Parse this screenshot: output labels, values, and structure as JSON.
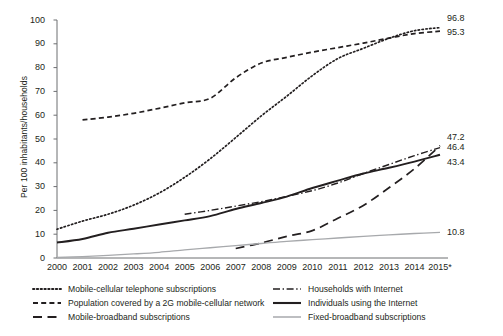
{
  "chart_data": {
    "type": "line",
    "title": "",
    "xlabel": "",
    "ylabel": "Per 100 inhabitants/households",
    "ylim": [
      0,
      100
    ],
    "ytick_step": 10,
    "yticks": [
      0,
      10,
      20,
      30,
      40,
      50,
      60,
      70,
      80,
      90,
      100
    ],
    "grid": false,
    "legend_position": "bottom",
    "categories": [
      "2000",
      "2001",
      "2002",
      "2003",
      "2004",
      "2005",
      "2006",
      "2007",
      "2008",
      "2009",
      "2010",
      "2011",
      "2012",
      "2013",
      "2014",
      "2015*"
    ],
    "x": [
      2000,
      2001,
      2002,
      2003,
      2004,
      2005,
      2006,
      2007,
      2008,
      2009,
      2010,
      2011,
      2012,
      2013,
      2014,
      2015
    ],
    "series": [
      {
        "name": "Mobile-cellular telephone subscriptions",
        "style": "dotted",
        "color": "#231f20",
        "end_label": "96.8",
        "values": [
          12.1,
          15.5,
          18.4,
          22.2,
          27.3,
          33.9,
          41.7,
          50.6,
          59.7,
          68.0,
          76.6,
          83.8,
          88.1,
          92.3,
          95.5,
          96.8
        ]
      },
      {
        "name": "Population covered by a 2G mobile-cellular network",
        "style": "dashed",
        "color": "#231f20",
        "end_label": "95.3",
        "values": [
          null,
          58.0,
          59.2,
          60.8,
          62.9,
          65.2,
          67.1,
          75.7,
          81.9,
          84.3,
          86.5,
          88.4,
          90.3,
          92.4,
          94.3,
          95.3
        ]
      },
      {
        "name": "Mobile-broadband subscriptions",
        "style": "long-dash",
        "color": "#231f20",
        "end_label": "47.2",
        "values": [
          null,
          null,
          null,
          null,
          null,
          null,
          null,
          4.0,
          6.3,
          9.1,
          11.5,
          16.7,
          22.1,
          29.5,
          37.5,
          47.2
        ]
      },
      {
        "name": "Households with Internet",
        "style": "dash-dot",
        "color": "#231f20",
        "end_label": "46.4",
        "values": [
          null,
          null,
          null,
          null,
          null,
          18.4,
          20.0,
          21.8,
          23.7,
          25.9,
          28.3,
          31.5,
          35.5,
          39.3,
          43.0,
          46.4
        ]
      },
      {
        "name": "Individuals using the Internet",
        "style": "solid",
        "color": "#231f20",
        "end_label": "43.4",
        "values": [
          6.5,
          8.0,
          10.6,
          12.3,
          14.1,
          15.8,
          17.6,
          20.6,
          23.1,
          25.8,
          29.4,
          32.5,
          35.5,
          37.9,
          40.5,
          43.4
        ]
      },
      {
        "name": "Fixed-broadband subscriptions",
        "style": "solid-grey",
        "color": "#a7a9ac",
        "end_label": "10.8",
        "values": [
          0.2,
          0.6,
          1.1,
          1.7,
          2.4,
          3.4,
          4.3,
          5.2,
          6.1,
          7.0,
          7.7,
          8.4,
          9.1,
          9.7,
          10.3,
          10.8
        ]
      }
    ],
    "end_labels": [
      {
        "text": "96.8",
        "value": 96.8
      },
      {
        "text": "95.3",
        "value": 95.3
      },
      {
        "text": "47.2",
        "value": 47.2
      },
      {
        "text": "46.4",
        "value": 46.4
      },
      {
        "text": "43.4",
        "value": 43.4
      },
      {
        "text": "10.8",
        "value": 10.8
      }
    ]
  },
  "legend": {
    "left_column": [
      {
        "label": "Mobile-cellular telephone subscriptions",
        "style": "dotted"
      },
      {
        "label": "Population covered by a 2G mobile-cellular network",
        "style": "dashed"
      },
      {
        "label": "Mobile-broadband subscriptions",
        "style": "long-dash"
      }
    ],
    "right_column": [
      {
        "label": "Households with Internet",
        "style": "dash-dot"
      },
      {
        "label": "Individuals using the Internet",
        "style": "solid"
      },
      {
        "label": "Fixed-broadband subscriptions",
        "style": "solid-grey"
      }
    ]
  }
}
